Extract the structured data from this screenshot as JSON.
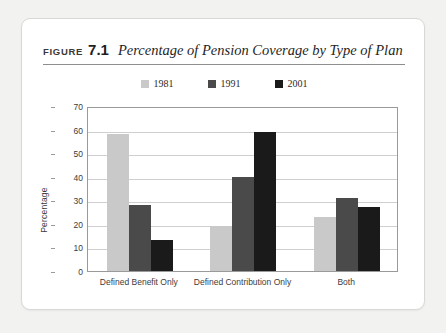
{
  "figure": {
    "label": "FIGURE",
    "number": "7.1",
    "title": "Percentage of Pension Coverage by Type of Plan"
  },
  "colors": {
    "series_1981": "#c9c9c9",
    "series_1991": "#4a4a4a",
    "series_2001": "#1a1a1a",
    "gridline": "#cfcfcf",
    "frame": "#9a9a9a",
    "card_background": "#ffffff",
    "page_background": "#f2f2f0"
  },
  "chart_data": {
    "type": "bar",
    "title": "Percentage of Pension Coverage by Type of Plan",
    "xlabel": "",
    "ylabel": "Percentage",
    "ylim": [
      0,
      70
    ],
    "ytick_step": 10,
    "yticks": [
      0,
      10,
      20,
      30,
      40,
      50,
      60,
      70
    ],
    "grid": true,
    "legend_position": "top-center",
    "categories": [
      "Defined Benefit Only",
      "Defined Contribution Only",
      "Both"
    ],
    "series": [
      {
        "name": "1981",
        "color": "#c9c9c9",
        "values": [
          58,
          19,
          23
        ]
      },
      {
        "name": "1991",
        "color": "#4a4a4a",
        "values": [
          28,
          40,
          31
        ]
      },
      {
        "name": "2001",
        "color": "#1a1a1a",
        "values": [
          13,
          59,
          27
        ]
      }
    ]
  }
}
